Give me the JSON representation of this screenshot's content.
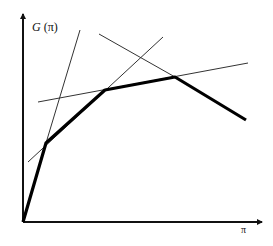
{
  "diagram": {
    "type": "piecewise-linear envelope of tangent lines",
    "y_axis": {
      "label_italic": "G",
      "label_rest": " (π)",
      "origin": [
        23,
        222
      ],
      "tip": [
        23,
        14
      ]
    },
    "x_axis": {
      "label": "π",
      "origin": [
        23,
        222
      ],
      "tip": [
        262,
        222
      ]
    },
    "colors": {
      "axis": "#111111",
      "curve": "#000000",
      "tangent": "#333333",
      "background": "#ffffff"
    },
    "curve": {
      "description": "thick piecewise-linear curve G(π)",
      "points": [
        [
          23,
          222
        ],
        [
          46,
          143
        ],
        [
          105,
          90
        ],
        [
          175,
          77
        ],
        [
          246,
          120
        ]
      ]
    },
    "tangent_lines": [
      {
        "name": "steep-line",
        "from": [
          46,
          143
        ],
        "to": [
          80,
          30
        ]
      },
      {
        "name": "second-line",
        "from": [
          28,
          162
        ],
        "to": [
          163,
          37
        ]
      },
      {
        "name": "flat-line",
        "from": [
          38,
          102
        ],
        "to": [
          248,
          63
        ]
      },
      {
        "name": "decreasing-line",
        "from": [
          99,
          34
        ],
        "to": [
          175,
          77
        ]
      }
    ]
  }
}
